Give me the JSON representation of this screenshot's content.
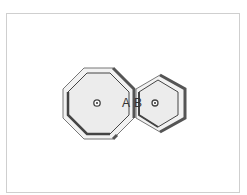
{
  "diagram": {
    "shapes": [
      {
        "name": "octagon",
        "sides": 8,
        "label": "A",
        "center": [
          97,
          103
        ]
      },
      {
        "name": "hexagon",
        "sides": 6,
        "label": "B",
        "center": [
          155,
          103
        ]
      }
    ],
    "labels": {
      "a": "A",
      "b": "B"
    },
    "colors": {
      "fill": "#ececec",
      "outline": "#555555",
      "shadow": "#5a5a5a",
      "rim": "#f4f4f4"
    }
  }
}
